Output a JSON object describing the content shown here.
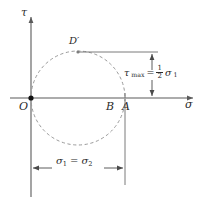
{
  "figure": {
    "axes": {
      "vertical_label": "τ",
      "horizontal_label": "σ"
    },
    "points": [
      {
        "id": "O",
        "label": "O",
        "x_px": 31,
        "y_px": 98,
        "marker": "filled-dot"
      },
      {
        "id": "B",
        "label": "B",
        "x_px": 113,
        "y_px": 98,
        "marker": "none"
      },
      {
        "id": "A",
        "label": "A",
        "x_px": 125,
        "y_px": 98,
        "marker": "tick"
      },
      {
        "id": "Dprime",
        "label": "D′",
        "x_px": 78,
        "y_px": 52,
        "marker": "small-dot"
      }
    ],
    "annotations": {
      "tau_max": {
        "symbol": "τ",
        "subscript": "max",
        "equals": "=",
        "fraction_numerator": "1",
        "fraction_denominator": "2",
        "variable": "σ",
        "variable_subscript": "1",
        "full_text": "τmax = ½ σ1"
      },
      "sigma_equality": {
        "left_variable": "σ",
        "left_subscript": "1",
        "equals": "=",
        "right_variable": "σ",
        "right_subscript": "2",
        "full_text": "σ1 = σ2"
      }
    },
    "geometry": {
      "circle": {
        "center_x_px": 78,
        "center_y_px": 98,
        "radius_px": 47,
        "style": "dashed"
      },
      "tau_axis": {
        "x_px": 31,
        "y_top_px": 14,
        "y_bottom_px": 197
      },
      "sigma_axis": {
        "y_px": 98,
        "x_left_px": 10,
        "x_right_px": 196
      },
      "dimension_horizontal": {
        "y_px": 168,
        "x_start_px": 31,
        "x_end_px": 125
      },
      "dimension_vertical": {
        "x_px": 152,
        "y_top_px": 52,
        "y_bottom_px": 98
      },
      "leader_from_dprime": {
        "y_px": 52,
        "x_start_px": 78,
        "x_end_px": 158
      }
    },
    "colors": {
      "axis": "#5a5a5a",
      "circle": "#9a9a9a",
      "dimension": "#4a4a4a",
      "text": "#2b2b2b",
      "background": "#ffffff",
      "point_fill": "#111111"
    }
  }
}
